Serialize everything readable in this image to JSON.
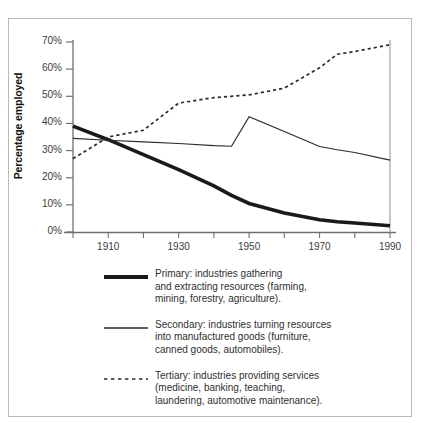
{
  "chart_data": {
    "type": "line",
    "title": "",
    "xlabel": "",
    "ylabel": "Percentage employed",
    "xlim": [
      1900,
      1990
    ],
    "ylim": [
      0,
      70
    ],
    "grid": false,
    "legend_position": "below",
    "x_ticks": [
      1910,
      1930,
      1950,
      1970,
      1990
    ],
    "x_tick_labels": [
      "1910",
      "1930",
      "1950",
      "1970",
      "1990"
    ],
    "x_minor_ticks": [
      1900,
      1910,
      1920,
      1930,
      1940,
      1950,
      1960,
      1970,
      1980,
      1990
    ],
    "y_ticks": [
      0,
      10,
      20,
      30,
      40,
      50,
      60,
      70
    ],
    "y_tick_labels": [
      "0%",
      "10%",
      "20%",
      "30%",
      "40%",
      "50%",
      "60%",
      "70%"
    ],
    "x": [
      1900,
      1910,
      1920,
      1930,
      1940,
      1945,
      1950,
      1960,
      1970,
      1975,
      1980,
      1990
    ],
    "series": [
      {
        "name": "Primary",
        "style": "thick-solid",
        "color": "#1a1a1a",
        "values": [
          39.0,
          34.0,
          28.5,
          23.0,
          17.0,
          13.5,
          10.5,
          7.0,
          4.5,
          3.8,
          3.3,
          2.3
        ]
      },
      {
        "name": "Secondary",
        "style": "thin-solid",
        "color": "#2b2b2b",
        "values": [
          34.5,
          33.8,
          33.2,
          32.6,
          31.8,
          31.6,
          42.5,
          37.0,
          31.5,
          30.3,
          29.3,
          26.5
        ]
      },
      {
        "name": "Tertiary",
        "style": "dotted",
        "color": "#2b2b2b",
        "values": [
          27.0,
          35.0,
          37.5,
          47.5,
          49.5,
          50.0,
          50.5,
          53.0,
          60.5,
          65.5,
          66.5,
          69.0
        ]
      }
    ]
  },
  "axis": {
    "y_title": "Percentage employed",
    "y_labels": [
      "70%",
      "60%",
      "50%",
      "40%",
      "30%",
      "20%",
      "10%",
      "0%"
    ],
    "x_labels": [
      "1910",
      "1930",
      "1950",
      "1970",
      "1990"
    ]
  },
  "legend": {
    "entries": [
      {
        "key": "primary",
        "swatch": "thick-solid-line",
        "text": "Primary: industries gathering\nand extracting resources (farming,\nmining, forestry, agriculture)."
      },
      {
        "key": "secondary",
        "swatch": "thin-solid-line",
        "text": "Secondary: industries turning resources\ninto manufactured goods (furniture,\ncanned goods, automobiles)."
      },
      {
        "key": "tertiary",
        "swatch": "dotted-line",
        "text": "Tertiary: industries providing services\n(medicine, banking, teaching,\nlaundering, automotive maintenance)."
      }
    ]
  },
  "colors": {
    "line": "#1a1a1a",
    "axis": "#6f6f6f",
    "frame": "#b9b9b9",
    "text": "#2f2f2f",
    "background": "#ffffff"
  }
}
